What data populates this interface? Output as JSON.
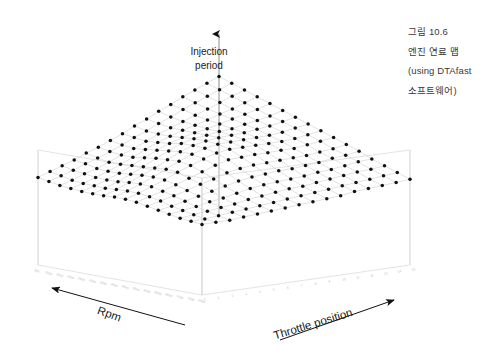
{
  "figure": {
    "kind": "3d-surface-mesh-plot",
    "background_color": "#ffffff",
    "marker_color": "#111111",
    "mesh_color": "#d2d2d2",
    "box_color": "#dcdcdc",
    "tick_color": "#b9b9b9",
    "axis_arrow_color": "#111111"
  },
  "caption": {
    "line1": "그림 10.6",
    "line2": "엔진 연료 맵",
    "line3": "(using DTAfast",
    "line4": "소프트웨어)"
  },
  "axes": {
    "z_title_line1": "Injection",
    "z_title_line2": "period",
    "x_title": "Rpm",
    "y_title": "Throttle position"
  },
  "chart_data": {
    "type": "surface",
    "title": "",
    "xlabel": "Rpm",
    "ylabel": "Throttle position",
    "zlabel": "Injection period",
    "grid": true,
    "legend": "none",
    "nx": 16,
    "ny": 16,
    "x_tick_labels": [
      "500",
      "1000",
      "1500",
      "2000",
      "2500",
      "3000",
      "3500",
      "4000",
      "4500",
      "5000",
      "5500",
      "6000",
      "6500",
      "7000",
      "7500",
      "8000"
    ],
    "y_tick_labels": [
      "0",
      "1",
      "2",
      "3",
      "4",
      "5",
      "6",
      "7",
      "8",
      "9",
      "10",
      "11",
      "12",
      "13",
      "14",
      "15"
    ],
    "zlim": [
      0,
      10
    ],
    "values": [
      [
        4.9,
        4.8,
        4.7,
        4.7,
        4.7,
        4.8,
        4.9,
        5.1,
        5.2,
        5.2,
        5.1,
        5.0,
        4.9,
        4.8,
        4.8,
        4.8
      ],
      [
        4.8,
        4.7,
        4.6,
        4.6,
        4.7,
        4.8,
        5.0,
        5.2,
        5.3,
        5.3,
        5.2,
        5.0,
        4.9,
        4.8,
        4.7,
        4.7
      ],
      [
        4.7,
        4.6,
        4.6,
        4.6,
        4.7,
        4.9,
        5.2,
        5.4,
        5.5,
        5.4,
        5.3,
        5.1,
        4.9,
        4.8,
        4.7,
        4.6
      ],
      [
        4.6,
        4.6,
        4.5,
        4.6,
        4.8,
        5.1,
        5.4,
        5.6,
        5.7,
        5.6,
        5.4,
        5.2,
        5.0,
        4.8,
        4.7,
        4.6
      ],
      [
        4.6,
        4.5,
        4.5,
        4.7,
        5.0,
        5.3,
        5.6,
        5.9,
        6.0,
        5.8,
        5.6,
        5.3,
        5.0,
        4.8,
        4.7,
        4.6
      ],
      [
        4.5,
        4.5,
        4.6,
        4.8,
        5.2,
        5.6,
        5.9,
        6.2,
        6.2,
        6.0,
        5.7,
        5.4,
        5.1,
        4.9,
        4.7,
        4.6
      ],
      [
        4.5,
        4.5,
        4.6,
        5.0,
        5.4,
        5.8,
        6.2,
        6.4,
        6.4,
        6.2,
        5.9,
        5.5,
        5.2,
        4.9,
        4.7,
        4.6
      ],
      [
        4.5,
        4.6,
        4.7,
        5.1,
        5.5,
        6.0,
        6.3,
        6.5,
        6.5,
        6.3,
        5.9,
        5.5,
        5.2,
        4.9,
        4.7,
        4.6
      ],
      [
        4.6,
        4.6,
        4.8,
        5.1,
        5.5,
        5.9,
        6.2,
        6.4,
        6.4,
        6.1,
        5.8,
        5.4,
        5.1,
        4.9,
        4.7,
        4.6
      ],
      [
        4.6,
        4.7,
        4.8,
        5.1,
        5.4,
        5.7,
        6.0,
        6.1,
        6.1,
        5.9,
        5.6,
        5.3,
        5.0,
        4.8,
        4.7,
        4.6
      ],
      [
        4.7,
        4.7,
        4.8,
        5.0,
        5.2,
        5.5,
        5.7,
        5.8,
        5.8,
        5.6,
        5.4,
        5.1,
        4.9,
        4.8,
        4.7,
        4.6
      ],
      [
        4.7,
        4.8,
        4.8,
        4.9,
        5.1,
        5.2,
        5.4,
        5.5,
        5.5,
        5.4,
        5.2,
        5.0,
        4.9,
        4.8,
        4.7,
        4.7
      ],
      [
        4.8,
        4.8,
        4.8,
        4.9,
        5.0,
        5.1,
        5.2,
        5.2,
        5.2,
        5.1,
        5.0,
        4.9,
        4.8,
        4.8,
        4.7,
        4.7
      ],
      [
        4.8,
        4.8,
        4.8,
        4.8,
        4.9,
        4.9,
        5.0,
        5.0,
        5.0,
        5.0,
        4.9,
        4.9,
        4.8,
        4.8,
        4.7,
        4.7
      ],
      [
        4.8,
        4.8,
        4.8,
        4.8,
        4.8,
        4.8,
        4.9,
        4.9,
        4.9,
        4.9,
        4.8,
        4.8,
        4.8,
        4.7,
        4.7,
        4.7
      ],
      [
        4.8,
        4.8,
        4.8,
        4.8,
        4.8,
        4.8,
        4.8,
        4.8,
        4.8,
        4.8,
        4.8,
        4.8,
        4.7,
        4.7,
        4.7,
        4.7
      ]
    ]
  }
}
